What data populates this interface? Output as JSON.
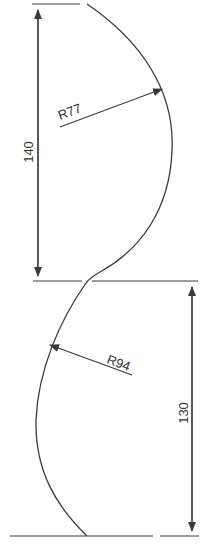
{
  "diagram": {
    "type": "technical-drawing",
    "colors": {
      "line": "#3a3a3a",
      "text": "#333333",
      "background": "#ffffff"
    },
    "dimensions": {
      "upper_height": {
        "label": "140",
        "orientation": "vertical"
      },
      "lower_height": {
        "label": "130",
        "orientation": "vertical"
      },
      "upper_radius": {
        "label": "R77"
      },
      "lower_radius": {
        "label": "R94"
      }
    }
  }
}
